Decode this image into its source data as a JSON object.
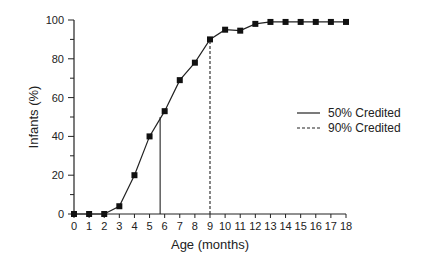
{
  "chart_data": {
    "type": "line",
    "title": "",
    "xlabel": "Age (months)",
    "ylabel": "Infants (%)",
    "x": [
      0,
      1,
      2,
      3,
      4,
      5,
      6,
      7,
      8,
      9,
      10,
      11,
      12,
      13,
      14,
      15,
      16,
      17,
      18
    ],
    "series": [
      {
        "name": "Infants (%)",
        "marker": "square",
        "values": [
          0,
          0,
          0,
          4,
          20,
          40,
          53,
          69,
          78,
          90,
          95,
          94.5,
          98,
          99,
          99,
          99,
          99,
          99,
          99
        ]
      }
    ],
    "reference_lines": [
      {
        "name": "50% Credited",
        "style": "solid",
        "x": 5.7,
        "y": 50
      },
      {
        "name": "90% Credited",
        "style": "dashed",
        "x": 9.0,
        "y": 90
      }
    ],
    "xlim": [
      0,
      18
    ],
    "ylim": [
      0,
      100
    ],
    "xticks": [
      0,
      1,
      2,
      3,
      4,
      5,
      6,
      7,
      8,
      9,
      10,
      11,
      12,
      13,
      14,
      15,
      16,
      17,
      18
    ],
    "yticks": [
      0,
      20,
      40,
      60,
      80,
      100
    ],
    "grid": false,
    "legend_position": "right-center"
  },
  "legend": {
    "solid_label": "50% Credited",
    "dashed_label": "90% Credited"
  },
  "axes": {
    "xlabel": "Age (months)",
    "ylabel": "Infants (%)"
  }
}
